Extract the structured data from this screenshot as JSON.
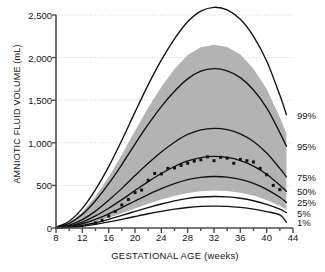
{
  "chart_data": {
    "type": "line",
    "title": "",
    "xlabel": "GESTATIONAL AGE (weeks)",
    "ylabel": "AMNIOTIC FLUID VOLUME (mL)",
    "xlim": [
      8,
      44
    ],
    "ylim": [
      0,
      2500
    ],
    "xticks": [
      8,
      12,
      16,
      20,
      24,
      28,
      32,
      36,
      40,
      44
    ],
    "yticks": [
      0,
      500,
      1000,
      1500,
      2000,
      2500
    ],
    "ytick_labels": [
      "0",
      "500",
      "1,000",
      "1,500",
      "2,000",
      "2,500"
    ],
    "xtick_minor_step": 2,
    "grid": "horizontal-dotted",
    "legend": "right-edge-curve-labels",
    "x": [
      8,
      10,
      12,
      14,
      16,
      18,
      20,
      22,
      24,
      26,
      28,
      30,
      32,
      34,
      36,
      38,
      40,
      42,
      43
    ],
    "series": [
      {
        "name": "99%",
        "label": "99%",
        "label_y": 1330,
        "values": [
          10,
          80,
          230,
          450,
          720,
          1030,
          1360,
          1680,
          1970,
          2220,
          2420,
          2545,
          2590,
          2560,
          2450,
          2250,
          1960,
          1560,
          1330
        ]
      },
      {
        "name": "95%",
        "label": "95%",
        "label_y": 960,
        "values": [
          8,
          55,
          160,
          320,
          520,
          745,
          985,
          1215,
          1425,
          1605,
          1750,
          1840,
          1870,
          1845,
          1765,
          1620,
          1410,
          1120,
          960
        ]
      },
      {
        "name": "75%",
        "label": "75%",
        "label_y": 600,
        "values": [
          5,
          33,
          98,
          198,
          325,
          465,
          615,
          760,
          893,
          1007,
          1098,
          1152,
          1170,
          1155,
          1105,
          1015,
          880,
          700,
          600
        ]
      },
      {
        "name": "50%",
        "label": "50%",
        "label_y": 430,
        "values": [
          4,
          24,
          70,
          142,
          232,
          333,
          440,
          545,
          640,
          722,
          787,
          826,
          840,
          828,
          792,
          727,
          631,
          502,
          430
        ]
      },
      {
        "name": "25%",
        "label": "25%",
        "label_y": 300,
        "values": [
          3,
          17,
          50,
          102,
          167,
          240,
          317,
          392,
          461,
          520,
          567,
          595,
          605,
          597,
          570,
          523,
          454,
          361,
          300
        ]
      },
      {
        "name": "5%",
        "label": "5%",
        "label_y": 180,
        "values": [
          2,
          10,
          30,
          62,
          102,
          147,
          194,
          240,
          282,
          318,
          347,
          364,
          370,
          365,
          349,
          320,
          278,
          221,
          180
        ]
      },
      {
        "name": "1%",
        "label": "1%",
        "label_y": 70,
        "values": [
          1,
          7,
          21,
          43,
          71,
          102,
          135,
          167,
          196,
          221,
          241,
          253,
          257,
          254,
          242,
          222,
          193,
          153,
          70
        ]
      }
    ],
    "band": {
      "name": "shaded-reference-range",
      "color": "#b3b3b3",
      "upper": [
        9,
        62,
        185,
        370,
        600,
        860,
        1140,
        1410,
        1655,
        1865,
        2030,
        2122,
        2150,
        2125,
        2035,
        1870,
        1630,
        1300,
        1110
      ],
      "lower": [
        2,
        12,
        36,
        74,
        121,
        174,
        230,
        285,
        335,
        377,
        411,
        432,
        439,
        433,
        414,
        380,
        330,
        262,
        215
      ]
    },
    "scatter": {
      "name": "observed-data-points",
      "marker": "square",
      "color": "#111111",
      "points": [
        {
          "x": 14,
          "y": 60
        },
        {
          "x": 15,
          "y": 90
        },
        {
          "x": 16,
          "y": 140
        },
        {
          "x": 17,
          "y": 195
        },
        {
          "x": 18,
          "y": 270
        },
        {
          "x": 19,
          "y": 335
        },
        {
          "x": 20,
          "y": 415
        },
        {
          "x": 21,
          "y": 445
        },
        {
          "x": 22,
          "y": 560
        },
        {
          "x": 23,
          "y": 640
        },
        {
          "x": 24,
          "y": 635
        },
        {
          "x": 25,
          "y": 700
        },
        {
          "x": 26,
          "y": 705
        },
        {
          "x": 27,
          "y": 735
        },
        {
          "x": 28,
          "y": 760
        },
        {
          "x": 29,
          "y": 785
        },
        {
          "x": 30,
          "y": 800
        },
        {
          "x": 31,
          "y": 835
        },
        {
          "x": 32,
          "y": 790
        },
        {
          "x": 33,
          "y": 830
        },
        {
          "x": 34,
          "y": 820
        },
        {
          "x": 35,
          "y": 760
        },
        {
          "x": 36,
          "y": 805
        },
        {
          "x": 37,
          "y": 790
        },
        {
          "x": 38,
          "y": 775
        },
        {
          "x": 39,
          "y": 700
        },
        {
          "x": 40,
          "y": 625
        },
        {
          "x": 41,
          "y": 500
        },
        {
          "x": 42,
          "y": 450
        }
      ]
    },
    "colors": {
      "curve": "#111111",
      "band": "#b3b3b3",
      "grid": "#c8c8c8",
      "axis": "#4d4d4d",
      "text": "#151515"
    }
  }
}
